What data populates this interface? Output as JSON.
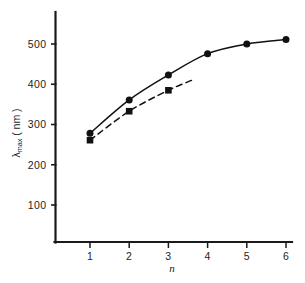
{
  "chart_data": {
    "type": "line",
    "title": "",
    "subtitle": "",
    "xlabel": "n",
    "ylabel": "λmax (nm)",
    "ylabel_parts": {
      "symbol": "λ",
      "subscript": "max",
      "units": "( nm )"
    },
    "x": [
      1,
      2,
      3,
      4,
      5,
      6
    ],
    "xlim": [
      0.45,
      6.5
    ],
    "ylim": [
      0,
      545
    ],
    "xticks": [
      1,
      2,
      3,
      4,
      5,
      6
    ],
    "xtick_labels": [
      "1",
      "2",
      "3",
      "4",
      "5",
      "6"
    ],
    "yticks": [
      100,
      200,
      300,
      400,
      500
    ],
    "ytick_labels": [
      "100",
      "200",
      "300",
      "400",
      "500"
    ],
    "grid": false,
    "legend": "none",
    "series": [
      {
        "name": "solid-curve",
        "style": "solid",
        "marker": "circle",
        "color": "#111111",
        "x": [
          1,
          2,
          3,
          4,
          5,
          6
        ],
        "values": [
          278,
          361,
          423,
          476,
          500,
          511
        ]
      },
      {
        "name": "dashed-curve",
        "style": "dashed",
        "marker": "square",
        "color": "#111111",
        "x": [
          1,
          2,
          3,
          3.6
        ],
        "values": [
          261,
          333,
          385,
          410
        ],
        "marker_x": [
          1,
          2,
          3
        ],
        "marker_values": [
          261,
          333,
          385
        ],
        "note": "dashed curve terminates without a marker near n = 3.6"
      }
    ]
  },
  "figure": {
    "background_color": "#ffffff",
    "axis_color": "#1a1a1a",
    "spines": [
      "left",
      "bottom"
    ]
  }
}
